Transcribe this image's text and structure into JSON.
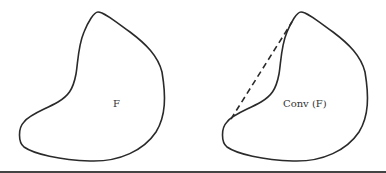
{
  "figure": {
    "left_shape": {
      "label": "F"
    },
    "right_shape": {
      "label": "Conv (F)"
    },
    "colors": {
      "stroke": "#2a2a2a",
      "background": "#ffffff",
      "rule": "#444444"
    }
  }
}
